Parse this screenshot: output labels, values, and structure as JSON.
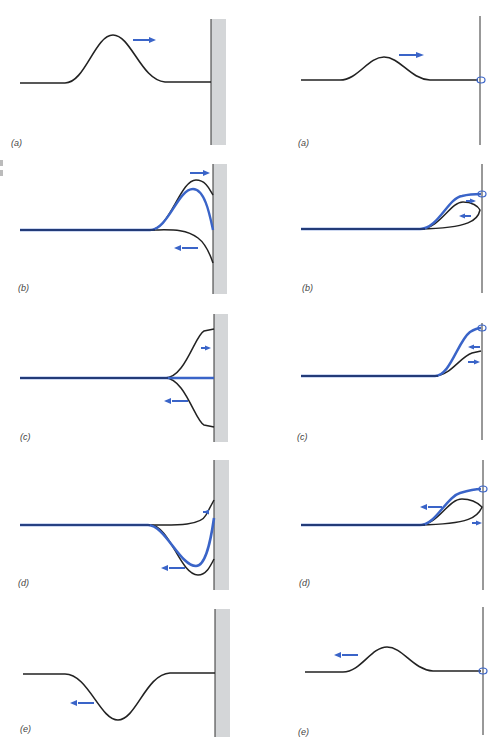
{
  "figure": {
    "colors": {
      "string": "#222222",
      "pulse_sum": "#3a64c8",
      "arrow": "#3a64c8",
      "wall_fill": "#d4d6d8",
      "wall_edge": "#333333",
      "ring": "#3a64c8"
    },
    "left_column": {
      "title": "Reflection at a fixed end (wall)",
      "panels": [
        {
          "label": "(a)",
          "description": "upright pulse traveling right toward the wall",
          "arrow_direction": "right"
        },
        {
          "label": "(b)",
          "description": "incident upright pulse and inverted reflected pulse overlap near wall; sum shown in blue",
          "arrow_directions": [
            "right",
            "left"
          ]
        },
        {
          "label": "(c)",
          "description": "incident and inverted pulses cancel at wall; sum is flat",
          "arrow_directions": [
            "right",
            "left"
          ]
        },
        {
          "label": "(d)",
          "description": "mostly reflected inverted pulse; sum shown in blue",
          "arrow_directions": [
            "right",
            "left"
          ]
        },
        {
          "label": "(e)",
          "description": "inverted pulse traveling left away from the wall",
          "arrow_direction": "left"
        }
      ]
    },
    "right_column": {
      "title": "Reflection at a free end (ring on rod)",
      "panels": [
        {
          "label": "(a)",
          "description": "upright pulse traveling right toward the free end",
          "arrow_direction": "right"
        },
        {
          "label": "(b)",
          "description": "incident and upright reflected pulse add near the end; sum shown in blue",
          "arrow_directions": [
            "right",
            "left"
          ]
        },
        {
          "label": "(c)",
          "description": "pulses add to double amplitude at free end",
          "arrow_directions": [
            "left",
            "right"
          ]
        },
        {
          "label": "(d)",
          "description": "upright reflected pulse moving away; sum shown in blue",
          "arrow_directions": [
            "left",
            "right"
          ]
        },
        {
          "label": "(e)",
          "description": "upright pulse traveling left away from the free end",
          "arrow_direction": "left"
        }
      ]
    }
  }
}
